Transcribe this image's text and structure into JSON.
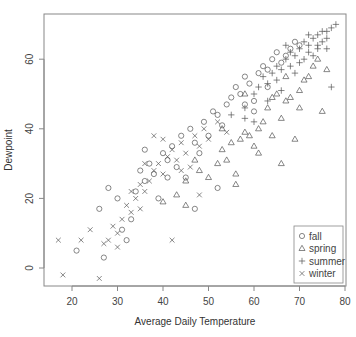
{
  "chart_data": {
    "type": "scatter",
    "title": "",
    "xlabel": "Average Daily Temperature",
    "ylabel": "Dewpoint",
    "xlim": [
      16,
      80
    ],
    "ylim": [
      -5,
      71
    ],
    "x_ticks": [
      20,
      30,
      40,
      50,
      60,
      70,
      80
    ],
    "y_ticks": [
      0,
      20,
      40,
      60
    ],
    "grid": false,
    "legend_position": "bottomright",
    "legend": [
      {
        "label": "fall",
        "symbol": "circle"
      },
      {
        "label": "spring",
        "symbol": "triangle"
      },
      {
        "label": "summer",
        "symbol": "plus"
      },
      {
        "label": "winter",
        "symbol": "x"
      }
    ],
    "series": [
      {
        "name": "fall",
        "symbol": "circle",
        "points": [
          [
            21,
            5
          ],
          [
            27,
            3
          ],
          [
            26,
            17
          ],
          [
            28,
            23
          ],
          [
            30,
            20
          ],
          [
            31,
            11
          ],
          [
            32,
            8
          ],
          [
            33,
            14
          ],
          [
            34,
            22
          ],
          [
            35,
            28
          ],
          [
            36,
            25
          ],
          [
            37,
            30
          ],
          [
            38,
            27
          ],
          [
            39,
            20
          ],
          [
            40,
            33
          ],
          [
            41,
            31
          ],
          [
            42,
            35
          ],
          [
            43,
            29
          ],
          [
            44,
            38
          ],
          [
            45,
            26
          ],
          [
            46,
            40
          ],
          [
            47,
            36
          ],
          [
            48,
            33
          ],
          [
            49,
            42
          ],
          [
            50,
            38
          ],
          [
            51,
            45
          ],
          [
            52,
            44
          ],
          [
            53,
            41
          ],
          [
            54,
            47
          ],
          [
            55,
            49
          ],
          [
            56,
            52
          ],
          [
            57,
            50
          ],
          [
            58,
            55
          ],
          [
            59,
            53
          ],
          [
            60,
            48
          ],
          [
            61,
            56
          ],
          [
            62,
            58
          ],
          [
            63,
            57
          ],
          [
            64,
            60
          ],
          [
            65,
            62
          ],
          [
            66,
            59
          ],
          [
            67,
            61
          ],
          [
            68,
            63
          ],
          [
            69,
            65
          ],
          [
            70,
            64
          ],
          [
            36,
            34
          ],
          [
            41,
            26
          ],
          [
            47,
            17
          ],
          [
            52,
            23
          ],
          [
            58,
            47
          ],
          [
            60,
            45
          ],
          [
            63,
            52
          ]
        ]
      },
      {
        "name": "spring",
        "symbol": "triangle",
        "points": [
          [
            40,
            19
          ],
          [
            43,
            21
          ],
          [
            45,
            25
          ],
          [
            47,
            31
          ],
          [
            48,
            28
          ],
          [
            50,
            26
          ],
          [
            52,
            30
          ],
          [
            53,
            34
          ],
          [
            54,
            31
          ],
          [
            55,
            36
          ],
          [
            56,
            27
          ],
          [
            57,
            37
          ],
          [
            58,
            39
          ],
          [
            59,
            38
          ],
          [
            60,
            35
          ],
          [
            61,
            40
          ],
          [
            62,
            42
          ],
          [
            63,
            46
          ],
          [
            64,
            38
          ],
          [
            65,
            50
          ],
          [
            66,
            43
          ],
          [
            67,
            48
          ],
          [
            68,
            49
          ],
          [
            69,
            37
          ],
          [
            70,
            51
          ],
          [
            71,
            54
          ],
          [
            72,
            55
          ],
          [
            73,
            58
          ],
          [
            74,
            60
          ],
          [
            75,
            45
          ],
          [
            76,
            57
          ],
          [
            56,
            24
          ],
          [
            61,
            33
          ],
          [
            66,
            30
          ],
          [
            70,
            46
          ],
          [
            58,
            50
          ],
          [
            64,
            49
          ],
          [
            67,
            55
          ],
          [
            53,
            40
          ],
          [
            45,
            18
          ]
        ]
      },
      {
        "name": "summer",
        "symbol": "plus",
        "points": [
          [
            55,
            44
          ],
          [
            58,
            46
          ],
          [
            60,
            50
          ],
          [
            61,
            52
          ],
          [
            62,
            55
          ],
          [
            63,
            53
          ],
          [
            64,
            56
          ],
          [
            65,
            58
          ],
          [
            66,
            57
          ],
          [
            67,
            60
          ],
          [
            68,
            62
          ],
          [
            69,
            61
          ],
          [
            70,
            63
          ],
          [
            71,
            65
          ],
          [
            72,
            64
          ],
          [
            73,
            66
          ],
          [
            74,
            67
          ],
          [
            75,
            68
          ],
          [
            76,
            68
          ],
          [
            77,
            69
          ],
          [
            78,
            70
          ],
          [
            65,
            54
          ],
          [
            68,
            58
          ],
          [
            70,
            59
          ],
          [
            72,
            62
          ],
          [
            74,
            64
          ],
          [
            76,
            63
          ],
          [
            60,
            42
          ],
          [
            63,
            48
          ],
          [
            66,
            51
          ],
          [
            69,
            56
          ],
          [
            71,
            60
          ],
          [
            73,
            61
          ],
          [
            75,
            65
          ],
          [
            77,
            52
          ],
          [
            58,
            43
          ],
          [
            67,
            64
          ],
          [
            72,
            67
          ],
          [
            74,
            63
          ],
          [
            76,
            66
          ]
        ]
      },
      {
        "name": "winter",
        "symbol": "x",
        "points": [
          [
            17,
            8
          ],
          [
            18,
            -2
          ],
          [
            22,
            8
          ],
          [
            24,
            11
          ],
          [
            26,
            -3
          ],
          [
            27,
            7
          ],
          [
            28,
            8
          ],
          [
            29,
            12
          ],
          [
            30,
            10
          ],
          [
            31,
            14
          ],
          [
            32,
            18
          ],
          [
            33,
            16
          ],
          [
            34,
            20
          ],
          [
            35,
            24
          ],
          [
            36,
            22
          ],
          [
            37,
            25
          ],
          [
            38,
            28
          ],
          [
            39,
            30
          ],
          [
            40,
            27
          ],
          [
            41,
            32
          ],
          [
            42,
            34
          ],
          [
            43,
            31
          ],
          [
            44,
            36
          ],
          [
            45,
            33
          ],
          [
            46,
            29
          ],
          [
            47,
            38
          ],
          [
            48,
            35
          ],
          [
            49,
            40
          ],
          [
            50,
            37
          ],
          [
            52,
            42
          ],
          [
            54,
            39
          ],
          [
            42,
            8
          ],
          [
            48,
            21
          ],
          [
            38,
            38
          ],
          [
            36,
            30
          ],
          [
            30,
            6
          ],
          [
            33,
            22
          ],
          [
            35,
            17
          ],
          [
            40,
            37
          ],
          [
            44,
            28
          ]
        ]
      }
    ]
  }
}
